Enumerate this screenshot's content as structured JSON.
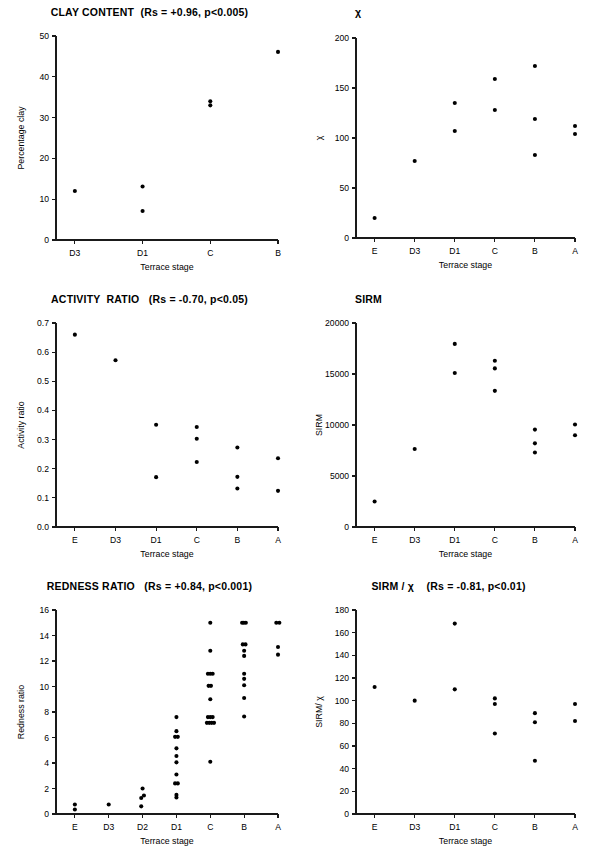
{
  "figure": {
    "panel_count": 6,
    "marker_color": "#000000",
    "axis_color": "#1a1a1a",
    "background": "#ffffff"
  },
  "panels": [
    {
      "id": "clay-content",
      "title": "CLAY CONTENT  (Rs = +0.96, p<0.005)",
      "chart_data": {
        "type": "scatter",
        "title": "CLAY CONTENT  (Rs = +0.96, p<0.005)",
        "xlabel": "Terrace stage",
        "ylabel": "Percentage clay",
        "categories": [
          "D3",
          "D1",
          "C",
          "B"
        ],
        "xtick_labels": [
          "D3",
          "D1",
          "C",
          "B"
        ],
        "ytick_labels": [
          "0",
          "10",
          "20",
          "30",
          "40",
          "50"
        ],
        "yticks": [
          0,
          10,
          20,
          30,
          40,
          50
        ],
        "ylim": [
          0,
          50
        ],
        "grid": false,
        "legend": "none",
        "points": [
          {
            "stage": "D3",
            "value": 12.0
          },
          {
            "stage": "D1",
            "value": 13.1
          },
          {
            "stage": "D1",
            "value": 7.1
          },
          {
            "stage": "C",
            "value": 34.0
          },
          {
            "stage": "C",
            "value": 33.0
          },
          {
            "stage": "B",
            "value": 46.1
          }
        ]
      }
    },
    {
      "id": "chi",
      "title": "χ",
      "chart_data": {
        "type": "scatter",
        "title": "χ",
        "xlabel": "Terrace stage",
        "ylabel": "χ",
        "categories": [
          "E",
          "D3",
          "D1",
          "C",
          "B",
          "A"
        ],
        "xtick_labels": [
          "E",
          "D3",
          "D1",
          "C",
          "B",
          "A"
        ],
        "ytick_labels": [
          "0",
          "50",
          "100",
          "150",
          "200"
        ],
        "yticks": [
          0,
          50,
          100,
          150,
          200
        ],
        "ylim": [
          0,
          200
        ],
        "grid": false,
        "legend": "none",
        "points": [
          {
            "stage": "E",
            "value": 20
          },
          {
            "stage": "D3",
            "value": 77
          },
          {
            "stage": "D1",
            "value": 135
          },
          {
            "stage": "D1",
            "value": 107
          },
          {
            "stage": "C",
            "value": 159
          },
          {
            "stage": "C",
            "value": 128
          },
          {
            "stage": "B",
            "value": 172
          },
          {
            "stage": "B",
            "value": 119
          },
          {
            "stage": "B",
            "value": 83
          },
          {
            "stage": "A",
            "value": 112
          },
          {
            "stage": "A",
            "value": 104
          }
        ]
      }
    },
    {
      "id": "activity-ratio",
      "title": "ACTIVITY  RATIO   (Rs = -0.70, p<0.05)",
      "chart_data": {
        "type": "scatter",
        "title": "ACTIVITY  RATIO   (Rs = -0.70, p<0.05)",
        "xlabel": "Terrace stage",
        "ylabel": "Activity ratio",
        "categories": [
          "E",
          "D3",
          "D1",
          "C",
          "B",
          "A"
        ],
        "xtick_labels": [
          "E",
          "D3",
          "D1",
          "C",
          "B",
          "A"
        ],
        "ytick_labels": [
          "0.0",
          "0.1",
          "0.2",
          "0.3",
          "0.4",
          "0.5",
          "0.6",
          "0.7"
        ],
        "yticks": [
          0.0,
          0.1,
          0.2,
          0.3,
          0.4,
          0.5,
          0.6,
          0.7
        ],
        "ylim": [
          0.0,
          0.7
        ],
        "grid": false,
        "legend": "none",
        "points": [
          {
            "stage": "E",
            "value": 0.66
          },
          {
            "stage": "D3",
            "value": 0.572
          },
          {
            "stage": "D1",
            "value": 0.351
          },
          {
            "stage": "D1",
            "value": 0.171
          },
          {
            "stage": "C",
            "value": 0.343
          },
          {
            "stage": "C",
            "value": 0.303
          },
          {
            "stage": "C",
            "value": 0.223
          },
          {
            "stage": "B",
            "value": 0.273
          },
          {
            "stage": "B",
            "value": 0.172
          },
          {
            "stage": "B",
            "value": 0.132
          },
          {
            "stage": "A",
            "value": 0.236
          },
          {
            "stage": "A",
            "value": 0.124
          }
        ]
      }
    },
    {
      "id": "sirm",
      "title": "SIRM",
      "chart_data": {
        "type": "scatter",
        "title": "SIRM",
        "xlabel": "Terrace stage",
        "ylabel": "SIRM",
        "categories": [
          "E",
          "D3",
          "D1",
          "C",
          "B",
          "A"
        ],
        "xtick_labels": [
          "E",
          "D3",
          "D1",
          "C",
          "B",
          "A"
        ],
        "ytick_labels": [
          "0",
          "5000",
          "10000",
          "15000",
          "20000"
        ],
        "yticks": [
          0,
          5000,
          10000,
          15000,
          20000
        ],
        "ylim": [
          0,
          20000
        ],
        "grid": false,
        "legend": "none",
        "points": [
          {
            "stage": "E",
            "value": 2500
          },
          {
            "stage": "D3",
            "value": 7650
          },
          {
            "stage": "D1",
            "value": 17950
          },
          {
            "stage": "D1",
            "value": 15100
          },
          {
            "stage": "C",
            "value": 16300
          },
          {
            "stage": "C",
            "value": 15550
          },
          {
            "stage": "C",
            "value": 13350
          },
          {
            "stage": "B",
            "value": 9550
          },
          {
            "stage": "B",
            "value": 8200
          },
          {
            "stage": "B",
            "value": 7300
          },
          {
            "stage": "A",
            "value": 10050
          },
          {
            "stage": "A",
            "value": 9000
          }
        ]
      }
    },
    {
      "id": "redness-ratio",
      "title": "REDNESS RATIO   (Rs = +0.84, p<0.001)",
      "chart_data": {
        "type": "scatter",
        "title": "REDNESS RATIO   (Rs = +0.84, p<0.001)",
        "xlabel": "Terrace stage",
        "ylabel": "Redness ratio",
        "categories": [
          "E",
          "D3",
          "D2",
          "D1",
          "C",
          "B",
          "A"
        ],
        "xtick_labels": [
          "E",
          "D3",
          "D2",
          "D1",
          "C",
          "B",
          "A"
        ],
        "ytick_labels": [
          "0",
          "2",
          "4",
          "6",
          "8",
          "10",
          "12",
          "14",
          "16"
        ],
        "yticks": [
          0,
          2,
          4,
          6,
          8,
          10,
          12,
          14,
          16
        ],
        "ylim": [
          0,
          16
        ],
        "grid": false,
        "legend": "none",
        "points": [
          {
            "stage": "E",
            "value": 0.75,
            "jitter": 0
          },
          {
            "stage": "E",
            "value": 0.35,
            "jitter": 0
          },
          {
            "stage": "D3",
            "value": 0.75,
            "jitter": 0
          },
          {
            "stage": "D2",
            "value": 2.0,
            "jitter": 0
          },
          {
            "stage": "D2",
            "value": 1.45,
            "jitter": 4
          },
          {
            "stage": "D2",
            "value": 1.25,
            "jitter": -4
          },
          {
            "stage": "D2",
            "value": 0.6,
            "jitter": -4
          },
          {
            "stage": "D1",
            "value": 7.6,
            "jitter": 0
          },
          {
            "stage": "D1",
            "value": 6.5,
            "jitter": 0
          },
          {
            "stage": "D1",
            "value": 6.05,
            "jitter": -4
          },
          {
            "stage": "D1",
            "value": 6.05,
            "jitter": 4
          },
          {
            "stage": "D1",
            "value": 5.15,
            "jitter": 0
          },
          {
            "stage": "D1",
            "value": 4.55,
            "jitter": 0
          },
          {
            "stage": "D1",
            "value": 4.05,
            "jitter": 0
          },
          {
            "stage": "D1",
            "value": 3.1,
            "jitter": 0
          },
          {
            "stage": "D1",
            "value": 2.4,
            "jitter": -4
          },
          {
            "stage": "D1",
            "value": 2.4,
            "jitter": 4
          },
          {
            "stage": "D1",
            "value": 1.5,
            "jitter": 0
          },
          {
            "stage": "D1",
            "value": 1.3,
            "jitter": 0
          },
          {
            "stage": "C",
            "value": 15.0,
            "jitter": 0
          },
          {
            "stage": "C",
            "value": 12.8,
            "jitter": 0
          },
          {
            "stage": "C",
            "value": 11.0,
            "jitter": -7
          },
          {
            "stage": "C",
            "value": 11.0,
            "jitter": 0
          },
          {
            "stage": "C",
            "value": 11.0,
            "jitter": 7
          },
          {
            "stage": "C",
            "value": 10.05,
            "jitter": -5
          },
          {
            "stage": "C",
            "value": 10.05,
            "jitter": 2
          },
          {
            "stage": "C",
            "value": 9.0,
            "jitter": 0
          },
          {
            "stage": "C",
            "value": 7.6,
            "jitter": -7
          },
          {
            "stage": "C",
            "value": 7.6,
            "jitter": 0
          },
          {
            "stage": "C",
            "value": 7.6,
            "jitter": 7
          },
          {
            "stage": "C",
            "value": 7.15,
            "jitter": -10
          },
          {
            "stage": "C",
            "value": 7.15,
            "jitter": -3
          },
          {
            "stage": "C",
            "value": 7.15,
            "jitter": 4
          },
          {
            "stage": "C",
            "value": 7.15,
            "jitter": 11
          },
          {
            "stage": "C",
            "value": 4.1,
            "jitter": 0
          },
          {
            "stage": "B",
            "value": 15.0,
            "jitter": -6
          },
          {
            "stage": "B",
            "value": 15.0,
            "jitter": -1
          },
          {
            "stage": "B",
            "value": 15.0,
            "jitter": 5
          },
          {
            "stage": "B",
            "value": 13.3,
            "jitter": -4
          },
          {
            "stage": "B",
            "value": 13.3,
            "jitter": 4
          },
          {
            "stage": "B",
            "value": 12.8,
            "jitter": 0
          },
          {
            "stage": "B",
            "value": 12.4,
            "jitter": 0
          },
          {
            "stage": "B",
            "value": 11.0,
            "jitter": 0
          },
          {
            "stage": "B",
            "value": 10.6,
            "jitter": 0
          },
          {
            "stage": "B",
            "value": 10.1,
            "jitter": 0
          },
          {
            "stage": "B",
            "value": 9.1,
            "jitter": 0
          },
          {
            "stage": "B",
            "value": 7.65,
            "jitter": 0
          },
          {
            "stage": "A",
            "value": 15.0,
            "jitter": -5
          },
          {
            "stage": "A",
            "value": 15.0,
            "jitter": 4
          },
          {
            "stage": "A",
            "value": 13.1,
            "jitter": 0
          },
          {
            "stage": "A",
            "value": 12.5,
            "jitter": 0
          }
        ]
      }
    },
    {
      "id": "sirm-over-chi",
      "title": "SIRM / χ    (Rs = -0.81, p<0.01)",
      "chart_data": {
        "type": "scatter",
        "title": "SIRM / χ    (Rs = -0.81, p<0.01)",
        "xlabel": "Terrace stage",
        "ylabel": "SIRM/ χ",
        "categories": [
          "E",
          "D3",
          "D1",
          "C",
          "B",
          "A"
        ],
        "xtick_labels": [
          "E",
          "D3",
          "D1",
          "C",
          "B",
          "A"
        ],
        "ytick_labels": [
          "0",
          "20",
          "40",
          "60",
          "80",
          "100",
          "120",
          "140",
          "160",
          "180"
        ],
        "yticks": [
          0,
          20,
          40,
          60,
          80,
          100,
          120,
          140,
          160,
          180
        ],
        "ylim": [
          0,
          180
        ],
        "grid": false,
        "legend": "none",
        "points": [
          {
            "stage": "E",
            "value": 112
          },
          {
            "stage": "D3",
            "value": 100
          },
          {
            "stage": "D1",
            "value": 168
          },
          {
            "stage": "D1",
            "value": 110
          },
          {
            "stage": "C",
            "value": 102
          },
          {
            "stage": "C",
            "value": 97
          },
          {
            "stage": "C",
            "value": 71
          },
          {
            "stage": "B",
            "value": 89
          },
          {
            "stage": "B",
            "value": 81
          },
          {
            "stage": "B",
            "value": 47
          },
          {
            "stage": "A",
            "value": 97
          },
          {
            "stage": "A",
            "value": 82
          }
        ]
      }
    }
  ]
}
